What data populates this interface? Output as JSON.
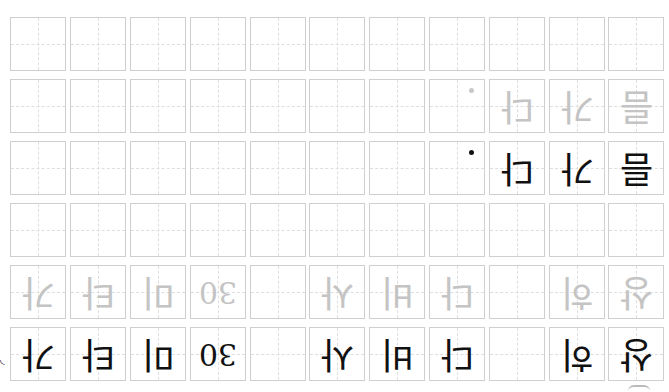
{
  "worksheet": {
    "type": "hangul-handwriting-practice-grid",
    "orientation": "rotated-180",
    "columns": 11,
    "colors": {
      "cell_border": "#cfcfcf",
      "guide_dash": "#dedede",
      "trace_ink": "#c4c4c4",
      "solid_ink": "#111111"
    },
    "rows": [
      {
        "style": "blank",
        "cells": [
          "",
          "",
          "",
          "",
          "",
          "",
          "",
          "",
          "",
          "",
          ""
        ]
      },
      {
        "style": "trace",
        "cells": [
          "",
          "",
          "",
          "",
          "",
          "",
          "",
          "·",
          "다",
          "가",
          "름"
        ]
      },
      {
        "style": "ink",
        "cells": [
          "",
          "",
          "",
          "",
          "",
          "",
          "",
          "·",
          "다",
          "가",
          "름"
        ]
      },
      {
        "style": "blank",
        "cells": [
          "",
          "",
          "",
          "",
          "",
          "",
          "",
          "",
          "",
          "",
          ""
        ]
      },
      {
        "style": "trace",
        "cells": [
          "가",
          "타",
          "미",
          "30",
          "",
          "사",
          "비",
          "다",
          "",
          "히",
          "상"
        ]
      },
      {
        "style": "ink",
        "cells": [
          "가",
          "타",
          "미",
          "30",
          "",
          "사",
          "비",
          "다",
          "",
          "히",
          "상"
        ]
      }
    ]
  }
}
